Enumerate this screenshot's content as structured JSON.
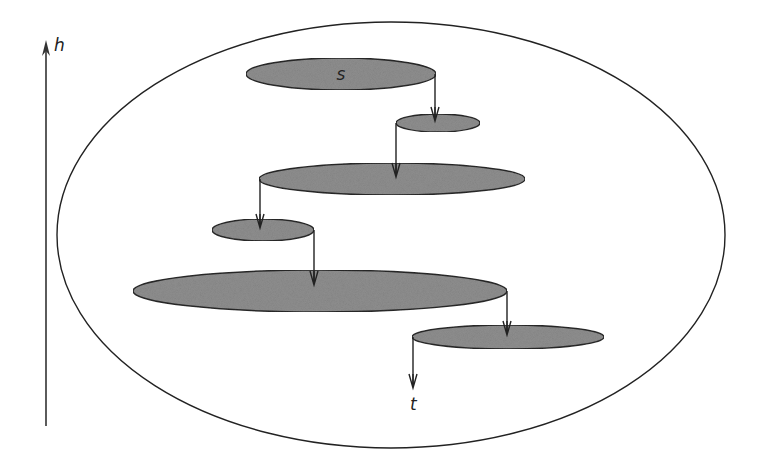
{
  "diagram": {
    "axis": {
      "label": "h",
      "x": 46,
      "y_top": 40,
      "y_bottom": 426
    },
    "outer_region": {
      "cx": 391,
      "cy": 235,
      "rx": 334,
      "ry": 213,
      "stroke": "#222222"
    },
    "fill_color": "#8f8f8f",
    "stroke_color": "#2a2a2a",
    "nodes": [
      {
        "id": "n1",
        "label": "s",
        "cx": 341,
        "cy": 74,
        "rx": 95,
        "ry": 16
      },
      {
        "id": "n2",
        "label": "",
        "cx": 438,
        "cy": 123,
        "rx": 42,
        "ry": 9
      },
      {
        "id": "n3",
        "label": "",
        "cx": 392,
        "cy": 179,
        "rx": 133,
        "ry": 16
      },
      {
        "id": "n4",
        "label": "",
        "cx": 263,
        "cy": 230,
        "rx": 51,
        "ry": 11
      },
      {
        "id": "n5",
        "label": "",
        "cx": 320,
        "cy": 291,
        "rx": 187,
        "ry": 21
      },
      {
        "id": "n6",
        "label": "",
        "cx": 508,
        "cy": 337,
        "rx": 96,
        "ry": 12
      }
    ],
    "arrows": [
      {
        "from": "n1",
        "to": "n2",
        "x": 435,
        "y1": 74,
        "y2": 121
      },
      {
        "from": "n2",
        "to": "n3",
        "x": 396,
        "y1": 123,
        "y2": 177
      },
      {
        "from": "n3",
        "to": "n4",
        "x": 260,
        "y1": 179,
        "y2": 228
      },
      {
        "from": "n4",
        "to": "n5",
        "x": 314,
        "y1": 230,
        "y2": 285
      },
      {
        "from": "n5",
        "to": "n6",
        "x": 507,
        "y1": 291,
        "y2": 335
      },
      {
        "from": "n6",
        "to": "t",
        "x": 413,
        "y1": 337,
        "y2": 388
      }
    ],
    "sink_label": {
      "text": "t",
      "x": 410,
      "y": 410
    }
  }
}
